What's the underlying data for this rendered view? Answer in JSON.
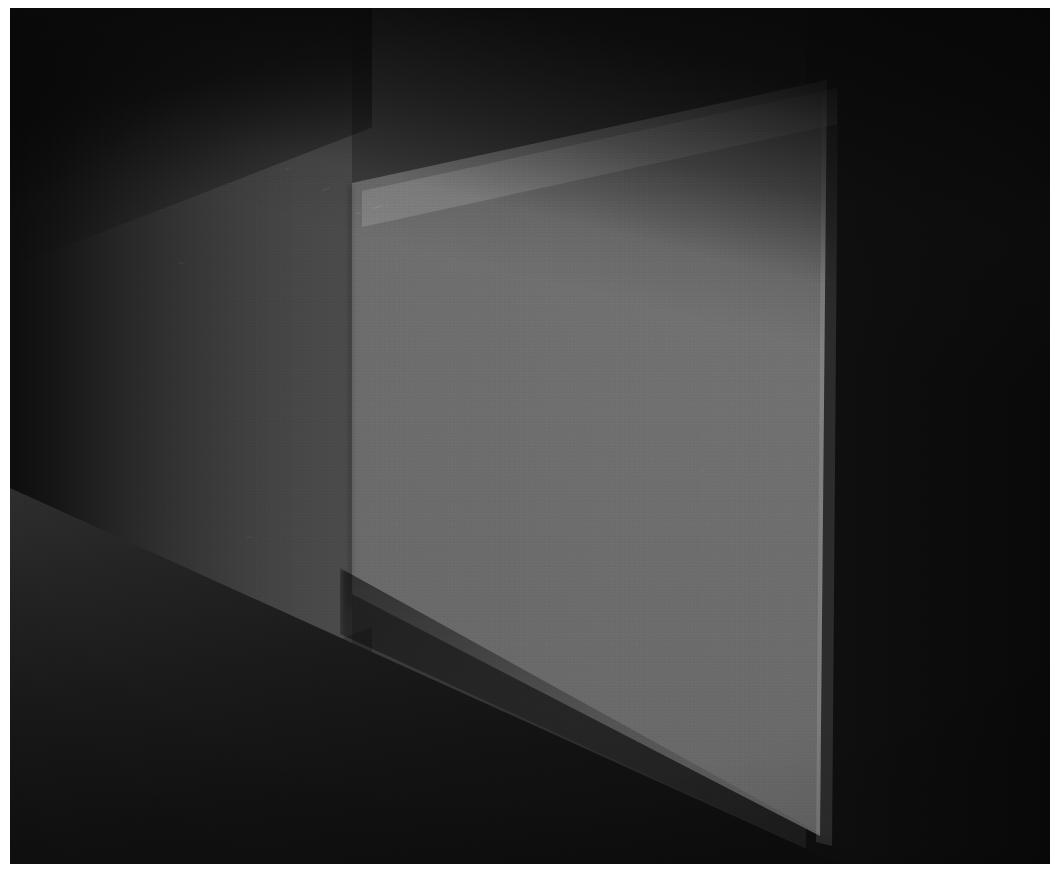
{
  "artwork": {
    "title": "Illuminated Corner",
    "medium": "photograph",
    "orientation": "landscape",
    "caption": ""
  },
  "canvas": {
    "width_px": 1061,
    "height_px": 886,
    "border_color": "#ffffff",
    "border_width_px": 10
  },
  "scene": {
    "subject": "dark interior room corner with a single brightly lit wall plane",
    "elements": [
      {
        "name": "ceiling-plane",
        "label": "Ceiling",
        "color": "#0a0a0a"
      },
      {
        "name": "left-wall",
        "label": "Left receding wall",
        "color": "#4b4b4b"
      },
      {
        "name": "lit-panel",
        "label": "Illuminated wall panel",
        "color": "#6c6c6c"
      },
      {
        "name": "right-wall",
        "label": "Right dark wall",
        "color": "#0d0d0d"
      },
      {
        "name": "floor-plane",
        "label": "Floor",
        "color": "#1a1a1a"
      }
    ]
  },
  "colors": {
    "frame": "#ffffff",
    "ambient_dark": "#0b0b0b",
    "ceiling": "#080808",
    "left_wall_near": "#4b4b4b",
    "left_wall_far": "#0d0d0d",
    "lit_panel": "#6c6c6c",
    "lit_panel_highlight": "#8a8a8a",
    "right_wall": "#0d0d0d",
    "floor": "#1a1a1a",
    "floor_shadow": "#0c0c0c"
  },
  "geometry": {
    "lit_panel_corners": [
      {
        "name": "top-left",
        "x": 352,
        "y": 183
      },
      {
        "name": "top-right",
        "x": 827,
        "y": 80
      },
      {
        "name": "bottom-right",
        "x": 820,
        "y": 836
      },
      {
        "name": "bottom-left",
        "x": 352,
        "y": 594
      }
    ],
    "corner_seam_x": 352,
    "right_wall_start_x": 806,
    "horizon_hint_y": 480
  },
  "scuffs": [
    {
      "x": 372,
      "y": 206,
      "w": 11,
      "h": 2,
      "rot": -18,
      "opacity": 0.26
    },
    {
      "x": 356,
      "y": 212,
      "w": 6,
      "h": 2,
      "rot": -12,
      "opacity": 0.2
    },
    {
      "x": 322,
      "y": 188,
      "w": 8,
      "h": 2,
      "rot": -24,
      "opacity": 0.18
    },
    {
      "x": 285,
      "y": 168,
      "w": 5,
      "h": 2,
      "rot": -30,
      "opacity": 0.15
    },
    {
      "x": 178,
      "y": 262,
      "w": 7,
      "h": 2,
      "rot": 10,
      "opacity": 0.12
    },
    {
      "x": 700,
      "y": 470,
      "w": 4,
      "h": 2,
      "rot": 0,
      "opacity": 0.1
    },
    {
      "x": 246,
      "y": 536,
      "w": 6,
      "h": 2,
      "rot": -8,
      "opacity": 0.1
    }
  ]
}
